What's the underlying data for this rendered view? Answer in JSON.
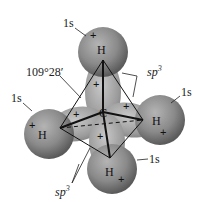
{
  "diagram": {
    "title": "",
    "center_atom": "C",
    "angle_label": "109°28′",
    "hybrid_label": "sp",
    "hybrid_superscript": "3",
    "atoms": [
      {
        "id": "top",
        "symbol": "H",
        "orbital": "1s"
      },
      {
        "id": "left",
        "symbol": "H",
        "orbital": "1s"
      },
      {
        "id": "right",
        "symbol": "H",
        "orbital": "1s"
      },
      {
        "id": "bottom",
        "symbol": "H",
        "orbital": "1s"
      }
    ],
    "sign": "+",
    "colors": {
      "sphere": "#8a8a8a",
      "sphere_dark": "#5e5e5e",
      "lobe": "#a0a0a0",
      "line": "#111111"
    }
  }
}
